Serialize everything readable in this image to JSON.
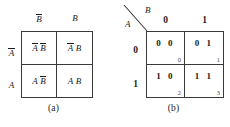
{
  "figure": {
    "type": "karnaugh-map-pair",
    "panels": [
      {
        "id": "a",
        "caption": "(a)",
        "variables": [
          "A",
          "B"
        ],
        "column_variable": "B",
        "row_variable": "A",
        "column_headers": [
          {
            "base": "B",
            "overbar": true
          },
          {
            "base": "B",
            "overbar": false
          }
        ],
        "row_headers": [
          {
            "base": "A",
            "overbar": true
          },
          {
            "base": "A",
            "overbar": false
          }
        ],
        "cells": [
          {
            "left": {
              "base": "A",
              "overbar": true
            },
            "right": {
              "base": "B",
              "overbar": true
            },
            "text": "A̅ B̅"
          },
          {
            "left": {
              "base": "A",
              "overbar": true
            },
            "right": {
              "base": "B",
              "overbar": false
            },
            "text": "A̅ B"
          },
          {
            "left": {
              "base": "A",
              "overbar": false
            },
            "right": {
              "base": "B",
              "overbar": true
            },
            "text": "A B̅"
          },
          {
            "left": {
              "base": "A",
              "overbar": false
            },
            "right": {
              "base": "B",
              "overbar": false
            },
            "text": "A B"
          }
        ]
      },
      {
        "id": "b",
        "caption": "(b)",
        "corner": {
          "row_var": "A",
          "col_var": "B"
        },
        "column_headers": [
          "0",
          "1"
        ],
        "row_headers": [
          "0",
          "1"
        ],
        "cells": [
          {
            "values": "0 0",
            "index": "0"
          },
          {
            "values": "0 1",
            "index": "1"
          },
          {
            "values": "1 0",
            "index": "2"
          },
          {
            "values": "1 1",
            "index": "3"
          }
        ]
      }
    ]
  },
  "colors": {
    "line": "#3a3a3a",
    "text": "#1a1a1a",
    "index_text": "#4a4a4a",
    "background": "#ffffff"
  }
}
